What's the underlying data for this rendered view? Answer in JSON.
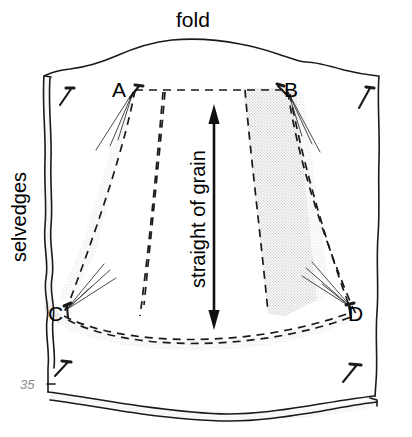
{
  "figure": {
    "page_number": "35",
    "labels": {
      "fold": "fold",
      "selvedges": "selvedges",
      "straight_of_grain": "straight of grain",
      "point_a": "A",
      "point_b": "B",
      "point_c": "C",
      "point_d": "D"
    },
    "colors": {
      "ink": "#1a1a1a",
      "shading": "#e2e2e2",
      "shading_edge": "#d2d2d2",
      "page_number": "#8c8c8c",
      "paper": "#ffffff"
    },
    "annotations": {
      "grain_arrow": "double-headed vertical arrow",
      "cutting_lines": "dashed",
      "pin_marks": "short angled strokes with heads at fabric corners"
    }
  }
}
